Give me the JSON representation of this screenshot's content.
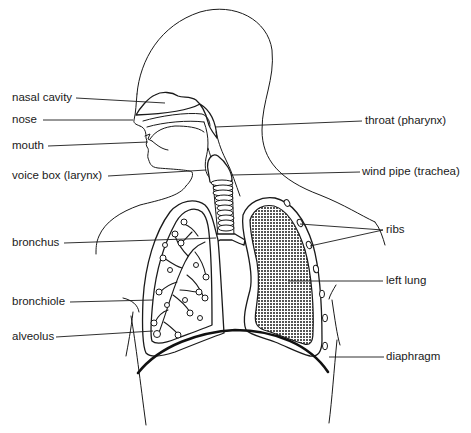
{
  "diagram": {
    "type": "anatomical-illustration",
    "colors": {
      "line": "#1a1a1a",
      "background": "#ffffff",
      "left_lung_fill": "#7a7a7a"
    },
    "labels": {
      "nasal_cavity": "nasal cavity",
      "nose": "nose",
      "mouth": "mouth",
      "voice_box": "voice box (larynx)",
      "throat": "throat (pharynx)",
      "wind_pipe": "wind pipe (trachea)",
      "bronchus": "bronchus",
      "ribs": "ribs",
      "left_lung": "left lung",
      "bronchiole": "bronchiole",
      "alveolus": "alveolus",
      "diaphragm": "diaphragm"
    }
  }
}
